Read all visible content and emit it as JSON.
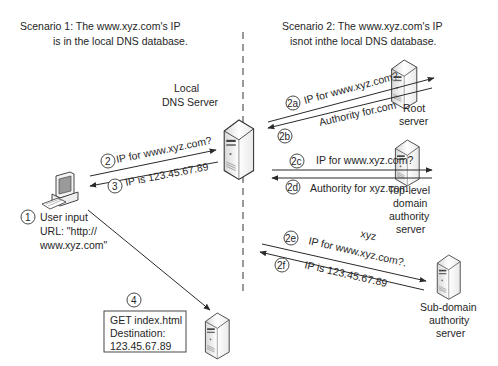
{
  "scenario1": {
    "title_line1": "Scenario 1: The www.xyz.com's IP",
    "title_line2": "is in the local DNS database."
  },
  "scenario2": {
    "title_line1": "Scenario 2: The www.xyz.com's IP",
    "title_line2": "isnot inthe local DNS database."
  },
  "nodes": {
    "local_dns": {
      "line1": "Local",
      "line2": "DNS Server"
    },
    "root": {
      "line1": "Root",
      "line2": "server"
    },
    "tld": {
      "line1": "Top-level",
      "line2": "domain",
      "line3": "authority",
      "line4": "server"
    },
    "subdomain": {
      "line1": "Sub-domain",
      "line2": "authority",
      "line3": "server"
    },
    "user": {
      "line1": "User input",
      "line2": "URL: \"http://",
      "line3": "www.xyz.com\""
    }
  },
  "steps": {
    "s1": "1",
    "s2": "2",
    "s3": "3",
    "s4": "4",
    "s2a": "2a",
    "s2b": "2b",
    "s2c": "2c",
    "s2d": "2d",
    "s2e": "2e",
    "s2f": "2f"
  },
  "messages": {
    "m2": "IP for www.xyz.com?",
    "m3": "IP is 123.45.67.89",
    "m2a": "IP for www.xyz.com?",
    "m2b": "Authority for.com",
    "m2c": "IP for www.xyz.com?",
    "m2d": "Authority for xyz.com",
    "m2e": "IP for www.xyz.com?.",
    "m2f": "IP is 123.45.67.89",
    "xyz_label": "xyz"
  },
  "request_box": {
    "line1": "GET index.html",
    "line2": "Destination:",
    "line3": "123.45.67.89"
  }
}
